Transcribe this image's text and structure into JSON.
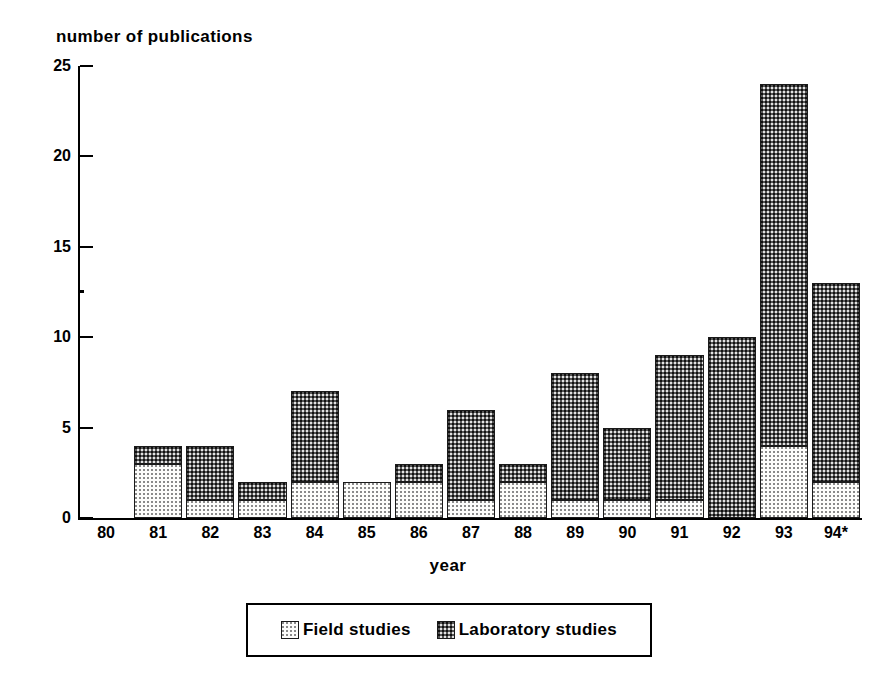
{
  "chart_data": {
    "type": "bar",
    "stacked": true,
    "title": "",
    "ylabel": "number of publications",
    "xlabel": "year",
    "categories": [
      "80",
      "81",
      "82",
      "83",
      "84",
      "85",
      "86",
      "87",
      "88",
      "89",
      "90",
      "91",
      "92",
      "93",
      "94*"
    ],
    "series": [
      {
        "name": "Field studies",
        "values": [
          0,
          3,
          1,
          1,
          2,
          2,
          2,
          1,
          2,
          1,
          1,
          1,
          0,
          4,
          2
        ],
        "pattern": "light-dotted",
        "color": "#fdfdfb"
      },
      {
        "name": "Laboratory studies",
        "values": [
          0,
          1,
          3,
          1,
          5,
          0,
          1,
          5,
          1,
          7,
          4,
          8,
          10,
          20,
          11
        ],
        "pattern": "dark-dotted",
        "color": "#565656"
      }
    ],
    "totals": [
      0,
      4,
      4,
      2,
      7,
      2,
      3,
      6,
      3,
      8,
      5,
      9,
      10,
      24,
      13
    ],
    "ylim": [
      0,
      25
    ],
    "yticks": [
      0,
      5,
      10,
      15,
      20,
      25
    ],
    "ytick_labels": [
      "0",
      "5",
      "10",
      "15",
      "20",
      "25"
    ],
    "grid": false,
    "legend_position": "bottom-center"
  },
  "legend": {
    "entries": [
      {
        "label": "Field studies",
        "swatch": "field"
      },
      {
        "label": "Laboratory studies",
        "swatch": "lab"
      }
    ]
  }
}
